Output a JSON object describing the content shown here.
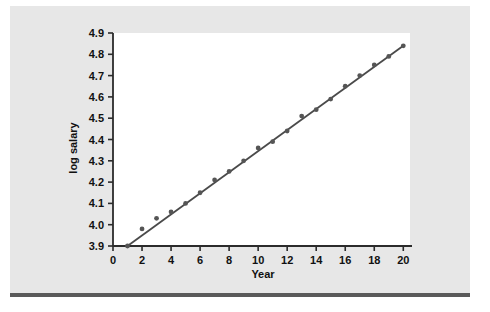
{
  "figure": {
    "background_color": "#e7e7e7",
    "plot_background_color": "#ffffff",
    "rule_color": "#5a5a5a",
    "axis_color": "#2b2b2b",
    "line_color": "#4a4a4a",
    "marker_color": "#555555"
  },
  "chart_data": {
    "type": "scatter",
    "title": "",
    "subtitle": "",
    "xlabel": "Year",
    "ylabel": "log salary",
    "xlim": [
      0,
      20.6
    ],
    "ylim": [
      3.9,
      4.9
    ],
    "xticks": [
      0,
      2,
      4,
      6,
      8,
      10,
      12,
      14,
      16,
      18,
      20
    ],
    "xtick_labels": [
      "0",
      "2",
      "4",
      "6",
      "8",
      "10",
      "12",
      "14",
      "16",
      "18",
      "20"
    ],
    "yticks": [
      3.9,
      4.0,
      4.1,
      4.2,
      4.3,
      4.4,
      4.5,
      4.6,
      4.7,
      4.8,
      4.9
    ],
    "ytick_labels": [
      "3.9",
      "4.0",
      "4.1",
      "4.2",
      "4.3",
      "4.4",
      "4.5",
      "4.6",
      "4.7",
      "4.8",
      "4.9"
    ],
    "grid": false,
    "legend": null,
    "legend_position": "none",
    "x": [
      1,
      2,
      3,
      4,
      5,
      6,
      7,
      8,
      9,
      10,
      11,
      12,
      13,
      14,
      15,
      16,
      17,
      18,
      19,
      20
    ],
    "y": [
      3.9,
      3.98,
      4.03,
      4.06,
      4.1,
      4.15,
      4.21,
      4.25,
      4.3,
      4.36,
      4.39,
      4.44,
      4.51,
      4.54,
      4.59,
      4.65,
      4.7,
      4.75,
      4.79,
      4.84
    ],
    "series": [
      {
        "name": "observed",
        "type": "scatter",
        "x": [
          1,
          2,
          3,
          4,
          5,
          6,
          7,
          8,
          9,
          10,
          11,
          12,
          13,
          14,
          15,
          16,
          17,
          18,
          19,
          20
        ],
        "values": [
          3.9,
          3.98,
          4.03,
          4.06,
          4.1,
          4.15,
          4.21,
          4.25,
          4.3,
          4.36,
          4.39,
          4.44,
          4.51,
          4.54,
          4.59,
          4.65,
          4.7,
          4.75,
          4.79,
          4.84
        ]
      },
      {
        "name": "fitted-line",
        "type": "line",
        "x": [
          1,
          20
        ],
        "values": [
          3.9,
          4.84
        ]
      }
    ],
    "annotations": []
  }
}
